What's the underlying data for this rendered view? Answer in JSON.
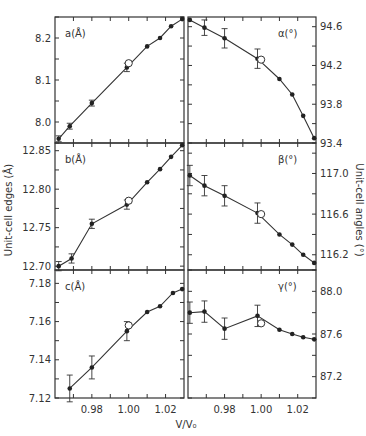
{
  "figure": {
    "xlabel": "V/V₀",
    "left_ylabel": "Unit-cell edges (Å)",
    "right_ylabel": "Unit-cell angles (°)"
  },
  "chart_data": [
    {
      "type": "line",
      "panel": "top-left",
      "label": "a(Å)",
      "xlim": [
        0.96,
        1.03
      ],
      "ylim": [
        7.95,
        8.25
      ],
      "yticks": [
        8.0,
        8.1,
        8.2
      ],
      "xticks": [
        0.98,
        1.0,
        1.02
      ],
      "points": [
        {
          "x": 0.962,
          "y": 7.96,
          "err": 0.007
        },
        {
          "x": 0.968,
          "y": 7.99,
          "err": 0.007
        },
        {
          "x": 0.98,
          "y": 8.045,
          "err": 0.007
        },
        {
          "x": 0.999,
          "y": 8.13,
          "err": 0.01
        },
        {
          "x": 1.01,
          "y": 8.18
        },
        {
          "x": 1.017,
          "y": 8.2
        },
        {
          "x": 1.023,
          "y": 8.228
        },
        {
          "x": 1.029,
          "y": 8.245
        }
      ],
      "open_point": {
        "x": 1.0,
        "y": 8.14
      }
    },
    {
      "type": "line",
      "panel": "top-right",
      "label": "α(°)",
      "xlim": [
        0.96,
        1.03
      ],
      "ylim": [
        93.4,
        94.7
      ],
      "yticks": [
        93.4,
        93.8,
        94.2,
        94.6
      ],
      "xticks": [
        0.98,
        1.0,
        1.02
      ],
      "points": [
        {
          "x": 0.961,
          "y": 94.67
        },
        {
          "x": 0.969,
          "y": 94.59,
          "err": 0.08
        },
        {
          "x": 0.98,
          "y": 94.48,
          "err": 0.1
        },
        {
          "x": 0.998,
          "y": 94.27,
          "err": 0.1
        },
        {
          "x": 1.01,
          "y": 94.06
        },
        {
          "x": 1.017,
          "y": 93.9
        },
        {
          "x": 1.023,
          "y": 93.68
        },
        {
          "x": 1.029,
          "y": 93.45
        }
      ],
      "open_point": {
        "x": 1.0,
        "y": 94.26
      }
    },
    {
      "type": "line",
      "panel": "middle-left",
      "label": "b(Å)",
      "xlim": [
        0.96,
        1.03
      ],
      "ylim": [
        12.695,
        12.86
      ],
      "yticks": [
        12.7,
        12.75,
        12.8,
        12.85
      ],
      "xticks": [
        0.98,
        1.0,
        1.02
      ],
      "points": [
        {
          "x": 0.962,
          "y": 12.7,
          "err": 0.006
        },
        {
          "x": 0.969,
          "y": 12.71,
          "err": 0.006
        },
        {
          "x": 0.98,
          "y": 12.755,
          "err": 0.006
        },
        {
          "x": 0.999,
          "y": 12.78,
          "err": 0.006
        },
        {
          "x": 1.01,
          "y": 12.809
        },
        {
          "x": 1.017,
          "y": 12.826
        },
        {
          "x": 1.023,
          "y": 12.842
        },
        {
          "x": 1.029,
          "y": 12.857
        }
      ],
      "open_point": {
        "x": 1.0,
        "y": 12.785
      }
    },
    {
      "type": "line",
      "panel": "middle-right",
      "label": "β(°)",
      "xlim": [
        0.96,
        1.03
      ],
      "ylim": [
        116.05,
        117.3
      ],
      "yticks": [
        116.2,
        116.6,
        117.0
      ],
      "xticks": [
        0.98,
        1.0,
        1.02
      ],
      "points": [
        {
          "x": 0.961,
          "y": 116.98,
          "err": 0.1
        },
        {
          "x": 0.969,
          "y": 116.88,
          "err": 0.1
        },
        {
          "x": 0.98,
          "y": 116.78,
          "err": 0.1
        },
        {
          "x": 0.998,
          "y": 116.61,
          "err": 0.1
        },
        {
          "x": 1.01,
          "y": 116.4
        },
        {
          "x": 1.017,
          "y": 116.3
        },
        {
          "x": 1.023,
          "y": 116.2
        },
        {
          "x": 1.029,
          "y": 116.12
        }
      ],
      "open_point": {
        "x": 1.0,
        "y": 116.6
      }
    },
    {
      "type": "line",
      "panel": "bottom-left",
      "label": "c(Å)",
      "xlim": [
        0.96,
        1.03
      ],
      "ylim": [
        7.12,
        7.187
      ],
      "yticks": [
        7.12,
        7.14,
        7.16,
        7.18
      ],
      "xticks": [
        0.98,
        1.0,
        1.02
      ],
      "points": [
        {
          "x": 0.968,
          "y": 7.125,
          "err": 0.007
        },
        {
          "x": 0.98,
          "y": 7.136,
          "err": 0.006
        },
        {
          "x": 0.999,
          "y": 7.155,
          "err": 0.005
        },
        {
          "x": 1.01,
          "y": 7.165
        },
        {
          "x": 1.017,
          "y": 7.168
        },
        {
          "x": 1.024,
          "y": 7.175
        },
        {
          "x": 1.029,
          "y": 7.177
        }
      ],
      "open_point": {
        "x": 1.0,
        "y": 7.158
      }
    },
    {
      "type": "line",
      "panel": "bottom-right",
      "label": "γ(°)",
      "xlim": [
        0.96,
        1.03
      ],
      "ylim": [
        87.0,
        88.2
      ],
      "yticks": [
        87.2,
        87.6,
        88.0
      ],
      "xticks": [
        0.98,
        1.0,
        1.02
      ],
      "points": [
        {
          "x": 0.961,
          "y": 87.8,
          "err": 0.1
        },
        {
          "x": 0.969,
          "y": 87.81,
          "err": 0.1
        },
        {
          "x": 0.98,
          "y": 87.65,
          "err": 0.1
        },
        {
          "x": 0.998,
          "y": 87.77,
          "err": 0.1
        },
        {
          "x": 1.01,
          "y": 87.64
        },
        {
          "x": 1.017,
          "y": 87.6
        },
        {
          "x": 1.023,
          "y": 87.57
        },
        {
          "x": 1.029,
          "y": 87.55
        }
      ],
      "open_point": {
        "x": 1.0,
        "y": 87.7
      }
    }
  ]
}
